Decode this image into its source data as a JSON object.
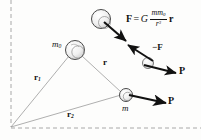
{
  "figure": {
    "background_color": "#fdfdfc",
    "ink_color": "#111111",
    "thin_line_color": "#9a9a9a",
    "dashed_border_color": "#a8a8a8",
    "sphere_fill": "#f2f2f2",
    "sphere_stroke": "#555555"
  },
  "equation": {
    "force_symbol": "F",
    "equals": "=",
    "gravitational_constant": "G",
    "numerator": "mm",
    "numerator_subscript": "0",
    "denominator": "r",
    "denominator_exponent": "3",
    "radius_vector": "r",
    "plain_text": "F = G mm0/r3 r"
  },
  "labels": {
    "mass_primary": "m",
    "mass_primary_subscript": "0",
    "mass_secondary": "m",
    "position_vector_1": "r",
    "position_vector_1_subscript": "1",
    "position_vector_2": "r",
    "position_vector_2_subscript": "2",
    "separation_vector": "r",
    "reaction_force": "−F",
    "momentum_upper": "P",
    "momentum_lower": "P"
  },
  "bodies": [
    {
      "name": "top-detached-sphere",
      "cx": 101,
      "cy": 19,
      "r": 9.5
    },
    {
      "name": "mass-m0-sphere",
      "cx": 75,
      "cy": 50,
      "r": 9.5
    },
    {
      "name": "mass-m-sphere",
      "cx": 126,
      "cy": 95,
      "r": 6.5
    },
    {
      "name": "reaction-sphere",
      "cx": 148,
      "cy": 63,
      "r": 5.5
    }
  ],
  "origin": {
    "x": 11,
    "y": 128
  },
  "vectors": [
    {
      "name": "force-F",
      "x1": 105,
      "y1": 23,
      "x2": 127,
      "y2": 42,
      "style": "thick"
    },
    {
      "name": "reaction-minusF",
      "x1": 154,
      "y1": 60,
      "x2": 127,
      "y2": 44,
      "style": "thick"
    },
    {
      "name": "momentum-upper",
      "x1": 143,
      "y1": 65,
      "x2": 178,
      "y2": 73,
      "style": "thick"
    },
    {
      "name": "momentum-lower",
      "x1": 129,
      "y1": 96,
      "x2": 168,
      "y2": 103,
      "style": "thick"
    }
  ]
}
